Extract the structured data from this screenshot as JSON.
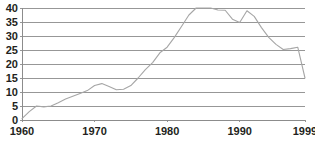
{
  "chart_data": {
    "type": "line",
    "title": "",
    "subtitle": "",
    "xlabel": "",
    "ylabel": "",
    "xlim": [
      1960,
      1999
    ],
    "ylim": [
      0,
      40
    ],
    "grid": true,
    "legend": false,
    "legend_position": "none",
    "xticks": [
      1960,
      1970,
      1980,
      1990,
      1999
    ],
    "xtick_labels": [
      "1960",
      "1970",
      "1980",
      "1990",
      "1999"
    ],
    "yticks": [
      0,
      5,
      10,
      15,
      20,
      25,
      30,
      35,
      40
    ],
    "ytick_labels": [
      "0",
      "5",
      "10",
      "15",
      "20",
      "25",
      "30",
      "35",
      "40"
    ],
    "line_color": "#a6a6a6",
    "grid_color": "#8c8c8c",
    "text_color": "#231f20",
    "background_color": "#ffffff",
    "x": [
      1960,
      1961,
      1962,
      1963,
      1964,
      1965,
      1966,
      1967,
      1968,
      1969,
      1970,
      1971,
      1972,
      1973,
      1974,
      1975,
      1976,
      1977,
      1978,
      1979,
      1980,
      1981,
      1982,
      1983,
      1984,
      1985,
      1986,
      1987,
      1988,
      1989,
      1990,
      1991,
      1992,
      1993,
      1994,
      1995,
      1996,
      1997,
      1998,
      1999
    ],
    "values": [
      0.5,
      3.0,
      5.0,
      4.7,
      5.0,
      6.2,
      7.5,
      8.5,
      9.5,
      10.5,
      12.3,
      13.0,
      12.0,
      10.8,
      11.0,
      12.3,
      15.0,
      18.0,
      20.5,
      24.0,
      26.0,
      29.5,
      33.5,
      37.5,
      40.0,
      40.0,
      40.0,
      39.3,
      39.2,
      36.0,
      34.8,
      39.0,
      37.0,
      33.0,
      29.5,
      27.0,
      25.2,
      25.5,
      26.0,
      15.0
    ],
    "series": [
      {
        "name": "series-1",
        "values": [
          0.5,
          3.0,
          5.0,
          4.7,
          5.0,
          6.2,
          7.5,
          8.5,
          9.5,
          10.5,
          12.3,
          13.0,
          12.0,
          10.8,
          11.0,
          12.3,
          15.0,
          18.0,
          20.5,
          24.0,
          26.0,
          29.5,
          33.5,
          37.5,
          40.0,
          40.0,
          40.0,
          39.3,
          39.2,
          36.0,
          34.8,
          39.0,
          37.0,
          33.0,
          29.5,
          27.0,
          25.2,
          25.5,
          26.0,
          15.0
        ]
      }
    ]
  },
  "plot": {
    "left": 22,
    "right": 305,
    "top": 8,
    "bottom": 120
  }
}
